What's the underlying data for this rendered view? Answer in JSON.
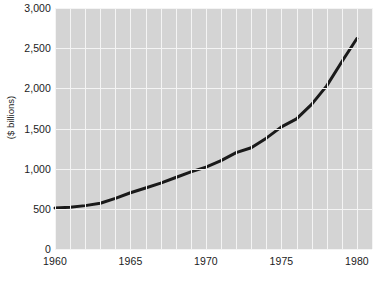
{
  "chart_data": {
    "type": "line",
    "title": "",
    "xlabel": "",
    "ylabel": "($ billions)",
    "xlim": [
      1960,
      1981
    ],
    "ylim": [
      0,
      3000
    ],
    "grid": true,
    "legend": "none",
    "y_ticks": [
      "0",
      "500",
      "1,000",
      "1,500",
      "2,000",
      "2,500",
      "3,000"
    ],
    "y_tick_values": [
      0,
      500,
      1000,
      1500,
      2000,
      2500,
      3000
    ],
    "x_ticks": [
      "1960",
      "1965",
      "1970",
      "1975",
      "1980"
    ],
    "x_tick_values": [
      1960,
      1965,
      1970,
      1975,
      1980
    ],
    "x_gridline_years": [
      1960,
      1961,
      1962,
      1963,
      1964,
      1965,
      1966,
      1967,
      1968,
      1969,
      1970,
      1971,
      1972,
      1973,
      1974,
      1975,
      1976,
      1977,
      1978,
      1979,
      1980,
      1981
    ],
    "series": [
      {
        "name": "value",
        "color": "#1a1a1a",
        "line_width": 3,
        "x": [
          1960,
          1961,
          1962,
          1963,
          1964,
          1965,
          1966,
          1967,
          1968,
          1969,
          1970,
          1971,
          1972,
          1973,
          1974,
          1975,
          1976,
          1977,
          1978,
          1979,
          1980
        ],
        "values": [
          510,
          520,
          540,
          570,
          630,
          700,
          760,
          820,
          890,
          960,
          1020,
          1100,
          1200,
          1260,
          1380,
          1520,
          1620,
          1800,
          2030,
          2330,
          2620
        ]
      }
    ],
    "colors": {
      "plot_background": "#d4d4d4",
      "gridline": "#f4f4f4",
      "page_background": "#ffffff",
      "text": "#1b1b1b",
      "line": "#1a1a1a"
    }
  }
}
